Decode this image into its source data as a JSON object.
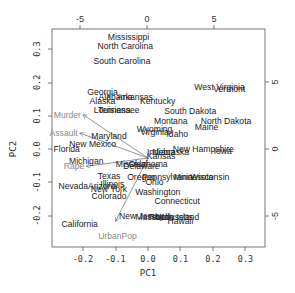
{
  "chart_data": {
    "type": "scatter",
    "subtype": "biplot",
    "xlabel": "PC1",
    "ylabel": "PC2",
    "xlim": [
      -0.27,
      0.36
    ],
    "ylim": [
      -0.29,
      0.36
    ],
    "x_ticks": [
      "-0.2",
      "-0.1",
      "0.0",
      "0.1",
      "0.2",
      "0.3"
    ],
    "y_ticks": [
      "-0.2",
      "-0.1",
      "0.0",
      "0.1",
      "0.2",
      "0.3"
    ],
    "top_ticks": [
      "-5",
      "0",
      "5"
    ],
    "right_ticks": [
      "-5",
      "0",
      "5"
    ],
    "grid": false,
    "points": [
      {
        "label": "Mississippi",
        "x": -0.06,
        "y": 0.335
      },
      {
        "label": "North Carolina",
        "x": -0.07,
        "y": 0.31
      },
      {
        "label": "South Carolina",
        "x": -0.08,
        "y": 0.265
      },
      {
        "label": "West Virginia",
        "x": 0.22,
        "y": 0.185
      },
      {
        "label": "Vermont",
        "x": 0.25,
        "y": 0.18
      },
      {
        "label": "Georgia",
        "x": -0.14,
        "y": 0.17
      },
      {
        "label": "Alabama",
        "x": -0.1,
        "y": 0.155
      },
      {
        "label": "Arkansas",
        "x": -0.04,
        "y": 0.155
      },
      {
        "label": "Alaska",
        "x": -0.14,
        "y": 0.145
      },
      {
        "label": "Kentucky",
        "x": 0.03,
        "y": 0.145
      },
      {
        "label": "Louisiana",
        "x": -0.11,
        "y": 0.118
      },
      {
        "label": "Tennessee",
        "x": -0.09,
        "y": 0.118
      },
      {
        "label": "South Dakota",
        "x": 0.13,
        "y": 0.115
      },
      {
        "label": "North Dakota",
        "x": 0.24,
        "y": 0.085
      },
      {
        "label": "Montana",
        "x": 0.07,
        "y": 0.085
      },
      {
        "label": "Maine",
        "x": 0.18,
        "y": 0.065
      },
      {
        "label": "Maryland",
        "x": -0.12,
        "y": 0.04
      },
      {
        "label": "Wyoming",
        "x": 0.02,
        "y": 0.06
      },
      {
        "label": "Virginia",
        "x": 0.02,
        "y": 0.05
      },
      {
        "label": "Idaho",
        "x": 0.09,
        "y": 0.045
      },
      {
        "label": "New Mexico",
        "x": -0.17,
        "y": 0.015
      },
      {
        "label": "Florida",
        "x": -0.25,
        "y": 0.0
      },
      {
        "label": "New Hampshire",
        "x": 0.17,
        "y": 0.0
      },
      {
        "label": "Iowa",
        "x": 0.23,
        "y": -0.005
      },
      {
        "label": "Indiana",
        "x": 0.04,
        "y": -0.01
      },
      {
        "label": "Nebraska",
        "x": 0.07,
        "y": -0.01
      },
      {
        "label": "Michigan",
        "x": -0.19,
        "y": -0.035
      },
      {
        "label": "Missouri",
        "x": -0.05,
        "y": -0.045
      },
      {
        "label": "Delaware",
        "x": -0.02,
        "y": -0.05
      },
      {
        "label": "Kansas",
        "x": 0.04,
        "y": -0.02
      },
      {
        "label": "Oklahoma",
        "x": 0.0,
        "y": -0.045
      },
      {
        "label": "Texas",
        "x": -0.12,
        "y": -0.08
      },
      {
        "label": "Oregon",
        "x": -0.02,
        "y": -0.085
      },
      {
        "label": "Pennsylvania",
        "x": 0.06,
        "y": -0.085
      },
      {
        "label": "Minnesota",
        "x": 0.14,
        "y": -0.085
      },
      {
        "label": "Wisconsin",
        "x": 0.19,
        "y": -0.085
      },
      {
        "label": "Ohio",
        "x": 0.02,
        "y": -0.1
      },
      {
        "label": "Illinois",
        "x": -0.11,
        "y": -0.105
      },
      {
        "label": "Nevada",
        "x": -0.23,
        "y": -0.11
      },
      {
        "label": "Arizona",
        "x": -0.14,
        "y": -0.11
      },
      {
        "label": "New York",
        "x": -0.12,
        "y": -0.12
      },
      {
        "label": "Washington",
        "x": 0.03,
        "y": -0.13
      },
      {
        "label": "Colorado",
        "x": -0.12,
        "y": -0.14
      },
      {
        "label": "Connecticut",
        "x": 0.09,
        "y": -0.155
      },
      {
        "label": "New Jersey",
        "x": -0.02,
        "y": -0.2
      },
      {
        "label": "Massachusetts",
        "x": 0.05,
        "y": -0.205
      },
      {
        "label": "Rhode Island",
        "x": 0.08,
        "y": -0.205
      },
      {
        "label": "Utah",
        "x": 0.05,
        "y": -0.205
      },
      {
        "label": "Hawaii",
        "x": 0.1,
        "y": -0.215
      },
      {
        "label": "California",
        "x": -0.21,
        "y": -0.225
      }
    ],
    "loadings": [
      {
        "label": "Murder",
        "x": -0.2,
        "y": 0.13
      },
      {
        "label": "Assault",
        "x": -0.21,
        "y": 0.075
      },
      {
        "label": "Rape",
        "x": -0.19,
        "y": -0.025
      },
      {
        "label": "UrbanPop",
        "x": -0.1,
        "y": -0.19
      }
    ]
  }
}
